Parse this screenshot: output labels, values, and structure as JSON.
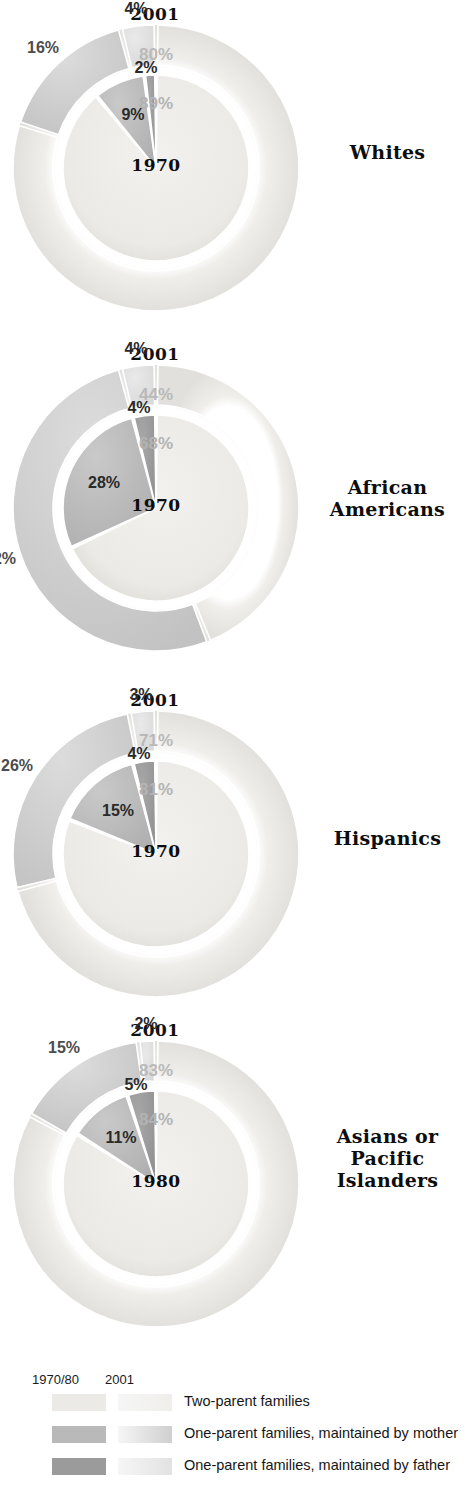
{
  "chart_data": [
    {
      "type": "pie",
      "title": "2001",
      "group": "Whites",
      "inner_year": "1970",
      "outer_year": "2001",
      "categories": [
        "Two-parent families",
        "One-parent families, maintained by mother",
        "One-parent families, maintained by father"
      ],
      "series": [
        {
          "name": "1970",
          "values": [
            89,
            9,
            2
          ],
          "labels": [
            "89%",
            "9%",
            "2%"
          ]
        },
        {
          "name": "2001",
          "values": [
            80,
            16,
            4
          ],
          "labels": [
            "80%",
            "16%",
            "4%"
          ]
        }
      ]
    },
    {
      "type": "pie",
      "title": "2001",
      "group": "African\nAmericans",
      "inner_year": "1970",
      "outer_year": "2001",
      "categories": [
        "Two-parent families",
        "One-parent families, maintained by mother",
        "One-parent families, maintained by father"
      ],
      "series": [
        {
          "name": "1970",
          "values": [
            68,
            28,
            4
          ],
          "labels": [
            "68%",
            "28%",
            "4%"
          ]
        },
        {
          "name": "2001",
          "values": [
            44,
            52,
            4
          ],
          "labels": [
            "44%",
            "52%",
            "4%"
          ]
        }
      ]
    },
    {
      "type": "pie",
      "title": "2001",
      "group": "Hispanics",
      "inner_year": "1970",
      "outer_year": "2001",
      "categories": [
        "Two-parent families",
        "One-parent families, maintained by mother",
        "One-parent families, maintained by father"
      ],
      "series": [
        {
          "name": "1970",
          "values": [
            81,
            15,
            4
          ],
          "labels": [
            "81%",
            "15%",
            "4%"
          ]
        },
        {
          "name": "2001",
          "values": [
            71,
            26,
            3
          ],
          "labels": [
            "71%",
            "26%",
            "3%"
          ]
        }
      ]
    },
    {
      "type": "pie",
      "title": "2001",
      "group": "Asians or\nPacific\nIslanders",
      "inner_year": "1980",
      "outer_year": "2001",
      "categories": [
        "Two-parent families",
        "One-parent families, maintained by mother",
        "One-parent families, maintained by father"
      ],
      "series": [
        {
          "name": "1980",
          "values": [
            84,
            11,
            5
          ],
          "labels": [
            "84%",
            "11%",
            "5%"
          ]
        },
        {
          "name": "2001",
          "values": [
            83,
            15,
            2
          ],
          "labels": [
            "83%",
            "15%",
            "2%"
          ]
        }
      ]
    }
  ],
  "charts": [
    {
      "title": "2001",
      "group_label": "Whites",
      "center_year": "1970",
      "outer_two_parent": "80%",
      "inner_two_parent": "89%",
      "inner_mother": "9%",
      "inner_father": "2%",
      "outer_mother": "16%",
      "outer_father": "4%"
    },
    {
      "title": "2001",
      "group_label": "African Americans",
      "center_year": "1970",
      "outer_two_parent": "44%",
      "inner_two_parent": "68%",
      "inner_mother": "28%",
      "inner_father": "4%",
      "outer_mother": "52%",
      "outer_father": "4%"
    },
    {
      "title": "2001",
      "group_label": "Hispanics",
      "center_year": "1970",
      "outer_two_parent": "71%",
      "inner_two_parent": "81%",
      "inner_mother": "15%",
      "inner_father": "4%",
      "outer_mother": "26%",
      "outer_father": "3%"
    },
    {
      "title": "2001",
      "group_label": "Asians or Pacific Islanders",
      "center_year": "1980",
      "outer_two_parent": "83%",
      "inner_two_parent": "84%",
      "inner_mother": "11%",
      "inner_father": "5%",
      "outer_mother": "15%",
      "outer_father": "2%"
    }
  ],
  "group_label_lines": {
    "c0": [
      "Whites"
    ],
    "c1": [
      "African",
      "Americans"
    ],
    "c2": [
      "Hispanics"
    ],
    "c3": [
      "Asians or",
      "Pacific",
      "Islanders"
    ]
  },
  "legend": {
    "header_inner": "1970/80",
    "header_outer": "2001",
    "rows": [
      {
        "label": "Two-parent families"
      },
      {
        "label": "One-parent families, maintained by mother"
      },
      {
        "label": "One-parent families, maintained by father"
      }
    ]
  },
  "colors": {
    "two_parent_inner": "#eceae6",
    "two_parent_outer": "#efeeeb",
    "mother_inner": "#b9b9b9",
    "mother_outer": "#cfcfcf",
    "father_inner": "#9b9b9b",
    "father_outer": "#e2e2e2",
    "text_dark": "#2a2a2a",
    "text_light": "#b9b9b9",
    "background": "#ffffff"
  }
}
